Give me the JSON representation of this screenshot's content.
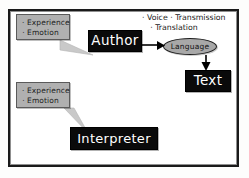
{
  "diagram": {
    "frame": {
      "border_color": "#1a1a1a",
      "background": "#ffffff"
    },
    "callouts": [
      {
        "name": "author-thoughts",
        "line1": "· Experience",
        "line2": "· Emotion",
        "fill": "#b0b0b0"
      },
      {
        "name": "interpreter-thoughts",
        "line1": "· Experience",
        "line2": "· Emotion",
        "fill": "#b0b0b0"
      }
    ],
    "nodes": {
      "author": {
        "label": "Author",
        "fill": "#0a0a0a",
        "text_color": "#ffffff"
      },
      "language": {
        "label": "Language",
        "fill": "#a8a8a8",
        "text_color": "#111111"
      },
      "text": {
        "label": "Text",
        "fill": "#0a0a0a",
        "text_color": "#ffffff"
      },
      "interpreter": {
        "label": "Interpreter",
        "fill": "#0a0a0a",
        "text_color": "#ffffff"
      }
    },
    "channel_notes": {
      "row1": "· Voice   · Transmission",
      "row2": "· Translation"
    },
    "arrows": [
      {
        "name": "author-to-language",
        "from": "author",
        "to": "language",
        "direction": "right"
      },
      {
        "name": "language-to-text",
        "from": "language",
        "to": "text",
        "direction": "down"
      }
    ]
  }
}
